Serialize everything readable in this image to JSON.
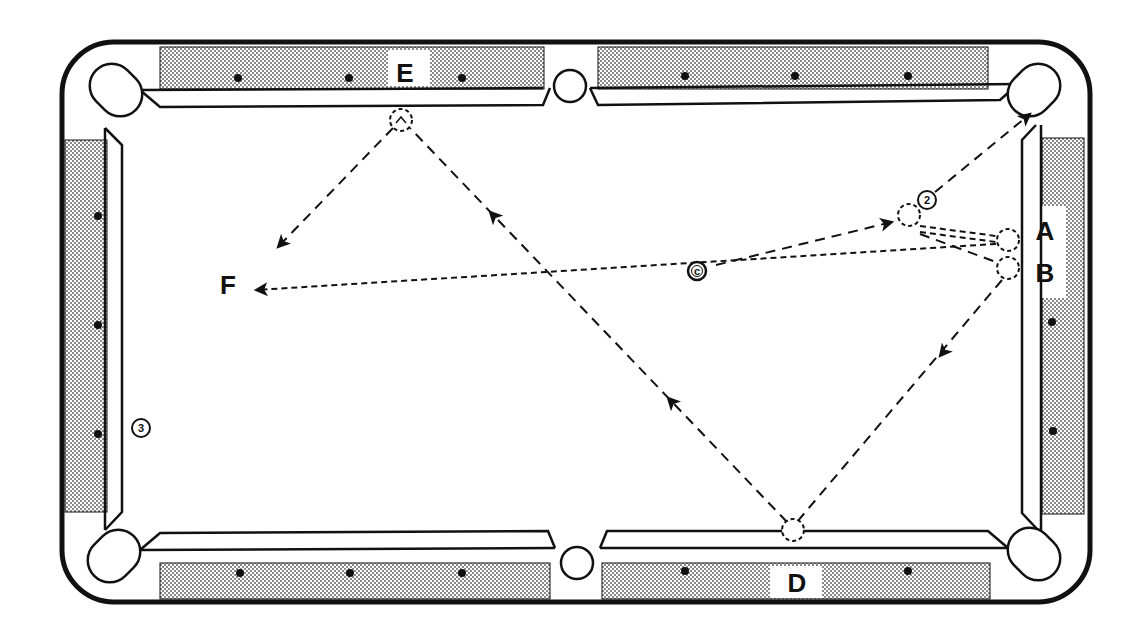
{
  "diagram": {
    "colors": {
      "ink": "#111111",
      "paper": "#ffffff",
      "rail_stipple": "#b9b9b9"
    },
    "labels": {
      "A": "A",
      "B": "B",
      "D": "D",
      "E": "E",
      "F": "F"
    },
    "balls": {
      "cue": "c",
      "two": "2",
      "three": "3"
    },
    "paths": [
      {
        "from": "cue ball",
        "to": "2 ball (contact)",
        "style": "dashed",
        "arrow": true
      },
      {
        "from": "2 ball",
        "to": "top-right corner pocket",
        "style": "dashed",
        "arrow": true
      },
      {
        "from": "2 ball contact",
        "to": "A (rail)",
        "style": "short-dashed",
        "arrow": false
      },
      {
        "from": "2 ball contact",
        "to": "B (rail)",
        "style": "dashed",
        "arrow": false
      },
      {
        "from": "A (rail)",
        "to": "F",
        "style": "short-dashed",
        "arrow": true
      },
      {
        "from": "B (rail)",
        "to": "D (bottom rail)",
        "style": "dashed",
        "arrow": true
      },
      {
        "from": "D (bottom rail)",
        "to": "E (top rail)",
        "style": "dashed",
        "arrow": true
      },
      {
        "from": "E (top rail)",
        "to": "F",
        "style": "dashed",
        "arrow": true
      }
    ]
  }
}
